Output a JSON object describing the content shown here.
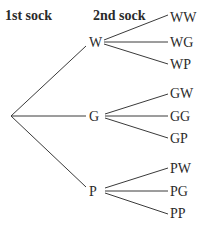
{
  "diagram": {
    "type": "tree",
    "headers": {
      "first": "1st sock",
      "second": "2nd sock"
    },
    "root": {
      "x": 11,
      "y": 116
    },
    "branches": [
      {
        "label": "W",
        "x": 95,
        "y": 42,
        "leaves": [
          {
            "label": "WW",
            "y": 18
          },
          {
            "label": "WG",
            "y": 42
          },
          {
            "label": "WP",
            "y": 64
          }
        ]
      },
      {
        "label": "G",
        "x": 95,
        "y": 116,
        "leaves": [
          {
            "label": "GW",
            "y": 93
          },
          {
            "label": "GG",
            "y": 116
          },
          {
            "label": "GP",
            "y": 138
          }
        ]
      },
      {
        "label": "P",
        "x": 95,
        "y": 191,
        "leaves": [
          {
            "label": "PW",
            "y": 168
          },
          {
            "label": "PG",
            "y": 191
          },
          {
            "label": "PP",
            "y": 213
          }
        ]
      }
    ]
  }
}
